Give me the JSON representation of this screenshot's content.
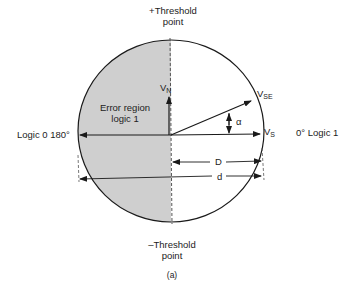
{
  "diagram": {
    "top_label_line1": "+Threshold",
    "top_label_line2": "point",
    "bottom_label_line1": "–Threshold",
    "bottom_label_line2": "point",
    "left_label": "Logic 0 180°",
    "right_label": "0° Logic 1",
    "error_region_line1": "Error region",
    "error_region_line2": "logic 1",
    "vn_main": "V",
    "vn_sub": "N",
    "vse_main": "V",
    "vse_sub": "SE",
    "vs_main": "V",
    "vs_sub": "S",
    "alpha": "α",
    "dim_D": "D",
    "dim_d": "d",
    "caption": "(a)",
    "colors": {
      "shade": "#cfcfcf",
      "line": "#1a1a1a"
    }
  }
}
